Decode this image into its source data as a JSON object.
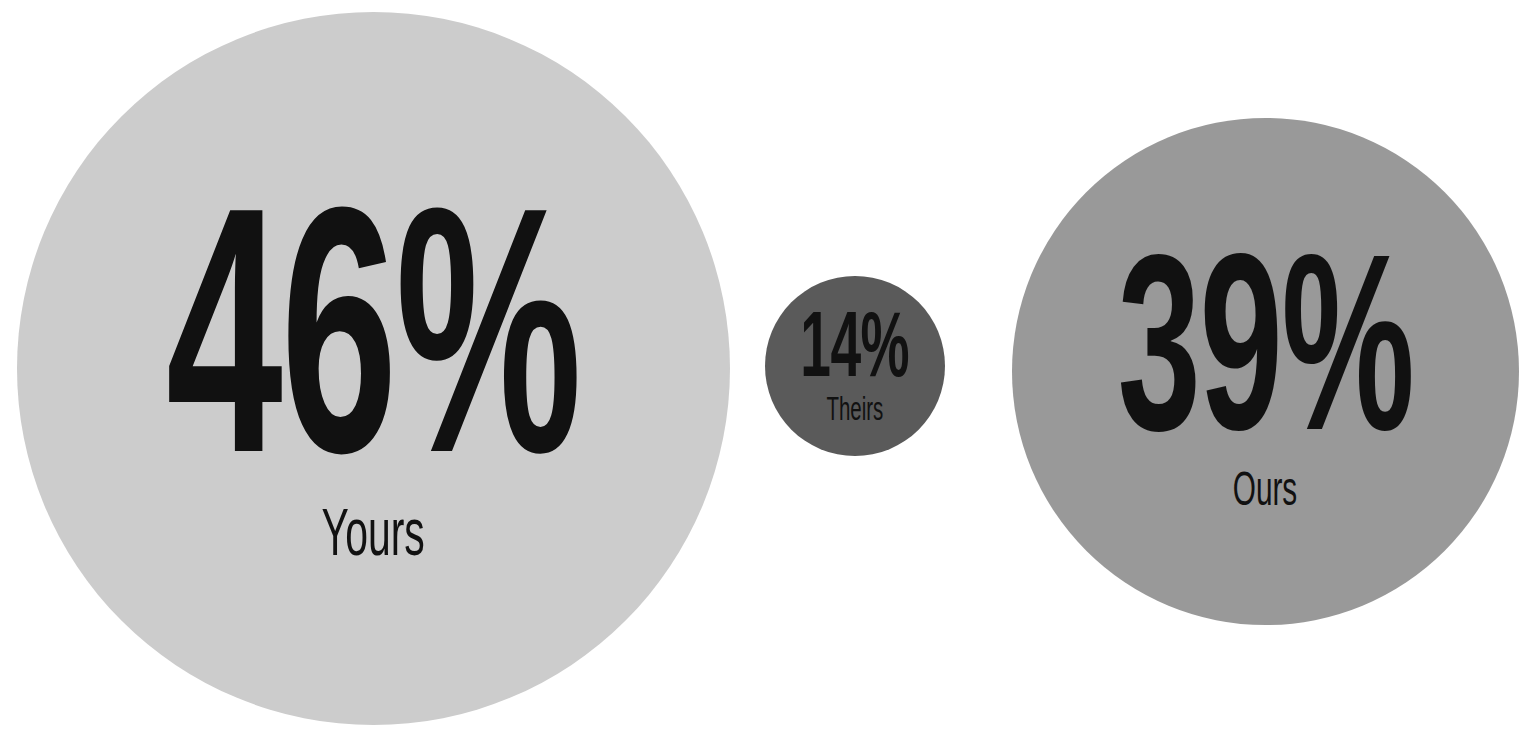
{
  "chart_data": {
    "type": "bubble",
    "title": "",
    "subtitle": "",
    "xlabel": "",
    "ylabel": "",
    "legend_position": "none",
    "grid": false,
    "units": "percent",
    "background_color": "#ffffff",
    "text_color": "#111111",
    "categories": [
      "Yours",
      "Theirs",
      "Ours"
    ],
    "values": [
      46,
      14,
      39
    ],
    "value_labels": [
      "46%",
      "14%",
      "39%"
    ],
    "bubbles": [
      {
        "id": "yours",
        "label": "Yours",
        "value": 46,
        "value_label": "46%",
        "color": "#cccccc",
        "diameter_px": 713,
        "center_x_px": 373,
        "center_y_px": 368
      },
      {
        "id": "theirs",
        "label": "Theirs",
        "value": 14,
        "value_label": "14%",
        "color": "#5a5a5a",
        "diameter_px": 180,
        "center_x_px": 855,
        "center_y_px": 366
      },
      {
        "id": "ours",
        "label": "Ours",
        "value": 39,
        "value_label": "39%",
        "color": "#999999",
        "diameter_px": 507,
        "center_x_px": 1265,
        "center_y_px": 371
      }
    ]
  }
}
